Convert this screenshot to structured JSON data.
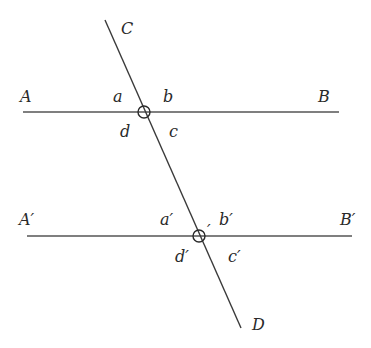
{
  "diagram": {
    "type": "parallel-lines-cut-by-transversal",
    "colors": {
      "line": "#3a3a3a",
      "horizontal_line": "#555555",
      "text": "#2a2a2a",
      "background": "#ffffff"
    },
    "lines": {
      "AB": {
        "x1": 23,
        "y1": 112,
        "x2": 339,
        "y2": 112
      },
      "A_prime_B_prime": {
        "x1": 27,
        "y1": 236,
        "x2": 352,
        "y2": 236
      },
      "CD": {
        "x1": 105,
        "y1": 20,
        "x2": 241,
        "y2": 328
      }
    },
    "points": {
      "O": {
        "cx": 144,
        "cy": 112,
        "r": 6
      },
      "O_prime": {
        "cx": 199,
        "cy": 236,
        "r": 6
      }
    },
    "labels": {
      "C": "C",
      "D": "D",
      "A": "A",
      "B": "B",
      "a": "a",
      "b": "b",
      "c": "c",
      "d": "d",
      "A_prime": "A′",
      "B_prime": "B′",
      "a_prime": "a′",
      "b_prime": "b′",
      "c_prime": "c′",
      "d_prime": "d′",
      "O_prime_mark": "′"
    }
  }
}
